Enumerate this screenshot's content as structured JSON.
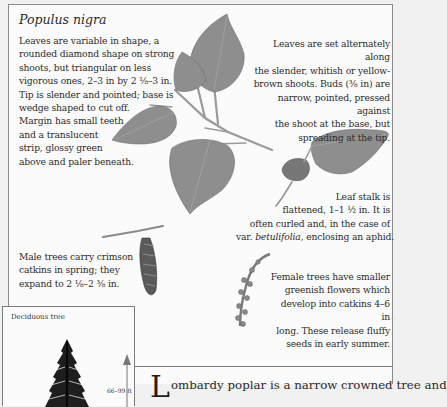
{
  "species": {
    "title": "Populus nigra"
  },
  "annotations": {
    "leaf_shape": [
      "Leaves are variable in shape, a",
      "rounded diamond shape on strong",
      "shoots, but triangular on less",
      "vigorous ones, 2–3 in by 2 ⅛–3 in.",
      "Tip is slender and pointed; base is",
      "wedge shaped to cut off.",
      "Margin has small teeth",
      "and a translucent",
      "strip, glossy green",
      "above and paler beneath."
    ],
    "leaf_arrangement": [
      "Leaves are set alternately along",
      "the slender, whitish or yellow-",
      "brown shoots. Buds (⅜ in) are",
      "narrow, pointed, pressed against",
      "the shoot at the base, but",
      "spreading at the tip."
    ],
    "leaf_stalk": {
      "lines": [
        "Leaf stalk is",
        "flattened, 1–1 ½ in. It is",
        "often curled and, in the case of"
      ],
      "last_prefix": "var. ",
      "last_italic": "betulifolia,",
      "last_suffix": " enclosing an aphid."
    },
    "male_catkins": [
      "Male trees carry crimson",
      "catkins in spring; they",
      "expand to 2 ⅛–2 ⅜ in."
    ],
    "female_catkins": [
      "Female trees have smaller",
      "greenish flowers which",
      "develop into catkins 4–6 in",
      "long. These release fluffy",
      "seeds in early summer."
    ]
  },
  "tree_box": {
    "label": "Deciduous tree",
    "height_label": "66–99 ft"
  },
  "body": {
    "drop_cap": "L",
    "first_line": "ombardy poplar is a narrow crowned tree and"
  },
  "illustrations": [
    "leafy-twig-icon",
    "curled-leaf-stalk-icon",
    "male-catkin-icon",
    "female-catkin-icon",
    "tree-silhouette-icon",
    "height-arrow-icon"
  ]
}
